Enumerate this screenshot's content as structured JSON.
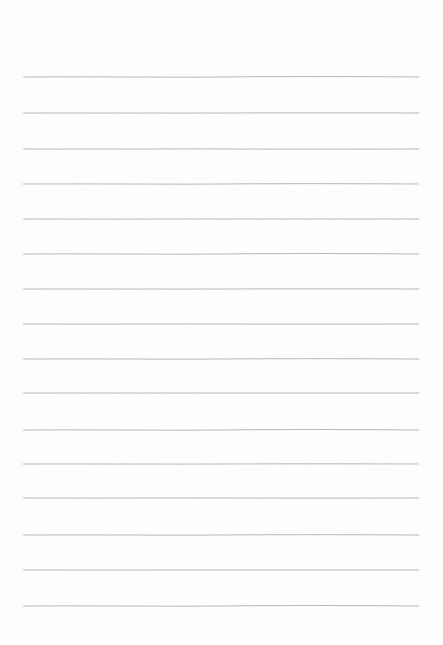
{
  "page": {
    "type": "lined-paper",
    "background_color": "#ffffff",
    "line_color": "#a9a9a9",
    "line_count": 16,
    "line_left": 23,
    "line_right": 419,
    "line_positions_y": [
      77,
      113,
      149,
      184,
      219,
      254,
      289,
      324,
      359,
      393,
      430,
      464,
      498,
      535,
      570,
      606
    ]
  }
}
